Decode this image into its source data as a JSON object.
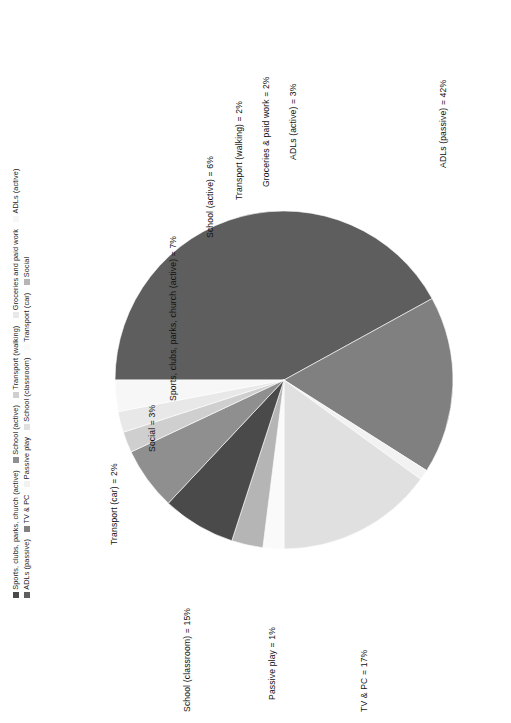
{
  "chart_data": {
    "type": "pie",
    "title": "",
    "subtitle": "",
    "xlabel": "",
    "ylabel": "",
    "rotation_deg": -90,
    "grid": false,
    "legend_position": "top-left-rotated",
    "legend_rows": [
      [
        "Sports, clubs, parks, church (active)",
        "School (active)",
        "Transport (walking)",
        "Groceries and paid work",
        "ADLs (active)"
      ],
      [
        "ADLs (passive)",
        "TV & PC",
        "Passive play",
        "School (classroom)",
        "Transport (car)",
        "Social"
      ]
    ],
    "categories": [
      "ADLs (passive)",
      "TV & PC",
      "Passive play",
      "School (classroom)",
      "Transport (car)",
      "Social",
      "Sports, clubs, parks, church (active)",
      "School (active)",
      "Transport (walking)",
      "Groceries and paid work",
      "ADLs (active)"
    ],
    "values": [
      42,
      17,
      1,
      15,
      2,
      3,
      7,
      6,
      2,
      2,
      3
    ],
    "unit": "%",
    "data_labels": [
      "ADLs (passive) = 42%",
      "TV & PC = 17%",
      "Passive play = 1%",
      "School (classroom) = 15%",
      "Transport (car) = 2%",
      "Social = 3%",
      "Sports, clubs, parks, church (active) = 7%",
      "School (active) = 6%",
      "Transport (walking) = 2%",
      "Groceries & paid work = 2%",
      "ADLs (active) = 3%"
    ],
    "colors": [
      "#5e5e5e",
      "#808080",
      "#f2f2f2",
      "#e0e0e0",
      "#fafafa",
      "#b5b5b5",
      "#4a4a4a",
      "#8f8f8f",
      "#cfcfcf",
      "#e8e8e8",
      "#f7f7f7"
    ]
  },
  "legend": {
    "rows": [
      {
        "items": [
          {
            "label": "Sports, clubs, parks, church (active)",
            "color": "#4a4a4a"
          },
          {
            "label": "School (active)",
            "color": "#8f8f8f"
          },
          {
            "label": "Transport (walking)",
            "color": "#cfcfcf"
          },
          {
            "label": "Groceries and paid work",
            "color": "#e8e8e8"
          },
          {
            "label": "ADLs (active)",
            "color": "#f7f7f7"
          }
        ]
      },
      {
        "items": [
          {
            "label": "ADLs (passive)",
            "color": "#5e5e5e"
          },
          {
            "label": "TV & PC",
            "color": "#808080"
          },
          {
            "label": "Passive play",
            "color": "#f2f2f2"
          },
          {
            "label": "School (classroom)",
            "color": "#e0e0e0"
          },
          {
            "label": "Transport (car)",
            "color": "#fafafa"
          },
          {
            "label": "Social",
            "color": "#b5b5b5"
          }
        ]
      }
    ]
  },
  "labels": {
    "adls_passive": "ADLs (passive) = 42%",
    "tv_pc": "TV & PC = 17%",
    "passive_play": "Passive play = 1%",
    "school_classroom": "School (classroom) = 15%",
    "transport_car": "Transport (car) = 2%",
    "social": "Social = 3%",
    "sports": "Sports, clubs, parks, church (active) = 7%",
    "school_active": "School (active) = 6%",
    "transport_walking": "Transport (walking) = 2%",
    "groceries": "Groceries & paid work = 2%",
    "adls_active": "ADLs (active) = 3%"
  }
}
